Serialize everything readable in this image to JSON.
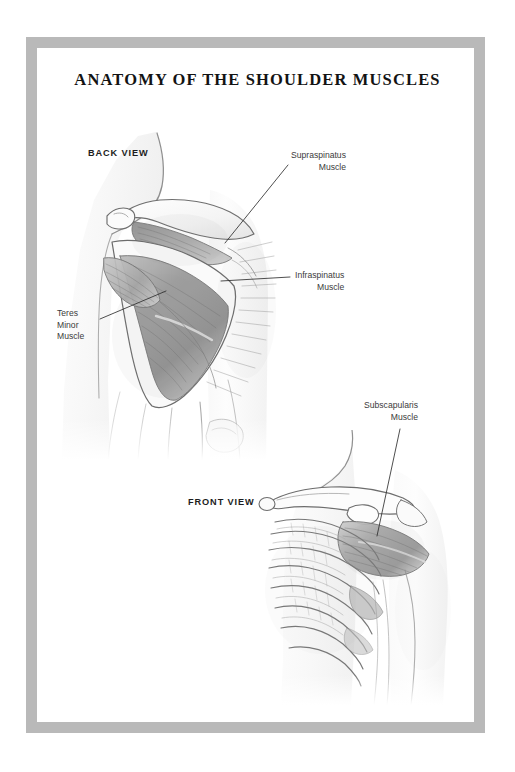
{
  "poster": {
    "title": "ANATOMY OF THE SHOULDER MUSCLES",
    "frame_color": "#b9b9b9",
    "background_color": "#ffffff",
    "ink_color": "#3b3b3b"
  },
  "views": [
    {
      "id": "back",
      "caption": "BACK VIEW"
    },
    {
      "id": "front",
      "caption": "FRONT VIEW"
    }
  ],
  "labels": {
    "supraspinatus": {
      "line1": "Supraspinatus",
      "line2": "Muscle"
    },
    "infraspinatus": {
      "line1": "Infraspinatus",
      "line2": "Muscle"
    },
    "teres_minor": {
      "line1": "Teres",
      "line2": "Minor",
      "line3": "Muscle"
    },
    "subscapularis": {
      "line1": "Subscapularis",
      "line2": "Muscle"
    }
  },
  "icons": {
    "back_view_illustration": "posterior-shoulder-illustration",
    "front_view_illustration": "anterior-shoulder-illustration",
    "leader_lines": "label-leader-lines"
  }
}
